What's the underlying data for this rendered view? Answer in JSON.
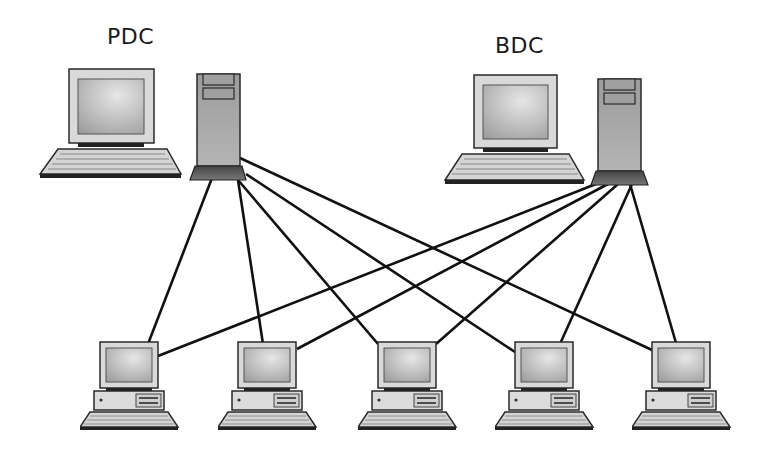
{
  "diagram": {
    "type": "network-topology",
    "servers": [
      {
        "id": "pdc",
        "label": "PDC",
        "x": 38,
        "y": 68
      },
      {
        "id": "bdc",
        "label": "BDC",
        "x": 443,
        "y": 78
      }
    ],
    "workstations": [
      {
        "id": "ws1",
        "x": 80
      },
      {
        "id": "ws2",
        "x": 218
      },
      {
        "id": "ws3",
        "x": 358
      },
      {
        "id": "ws4",
        "x": 495
      },
      {
        "id": "ws5",
        "x": 632
      }
    ],
    "connections": [
      {
        "from": "pdc",
        "to": "ws1"
      },
      {
        "from": "pdc",
        "to": "ws2"
      },
      {
        "from": "pdc",
        "to": "ws3"
      },
      {
        "from": "pdc",
        "to": "ws4"
      },
      {
        "from": "pdc",
        "to": "ws5"
      },
      {
        "from": "bdc",
        "to": "ws1"
      },
      {
        "from": "bdc",
        "to": "ws2"
      },
      {
        "from": "bdc",
        "to": "ws3"
      },
      {
        "from": "bdc",
        "to": "ws4"
      },
      {
        "from": "bdc",
        "to": "ws5"
      }
    ],
    "colors": {
      "line": "#111111",
      "outline": "#2a2a2a",
      "case": "#a8a8a8",
      "screen": "#b8b8b8",
      "bezel": "#d8d8d8"
    }
  }
}
